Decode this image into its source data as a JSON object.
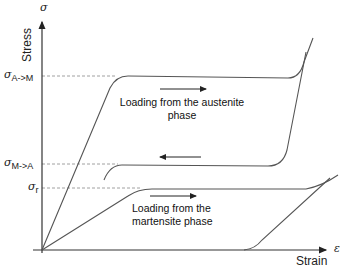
{
  "diagram": {
    "type": "stress-strain hysteresis (shape memory alloy)",
    "axes": {
      "y": {
        "symbol": "σ",
        "title": "Stress"
      },
      "x": {
        "symbol": "ε",
        "title": "Strain"
      }
    },
    "stress_levels": [
      {
        "id": "sigma_am",
        "symbol": "σ",
        "subscript": "A->M"
      },
      {
        "id": "sigma_ma",
        "symbol": "σ",
        "subscript": "M->A"
      },
      {
        "id": "sigma_r",
        "symbol": "σ",
        "subscript": "r"
      }
    ],
    "annotations": {
      "austenite": {
        "line1": "Loading from the austenite",
        "line2": "phase",
        "arrow": "right"
      },
      "unloading": {
        "arrow": "left"
      },
      "martensite": {
        "line1": "Loading from the",
        "line2": "martensite phase",
        "arrow": "right"
      }
    },
    "colors": {
      "curve": "#555555",
      "axis": "#333333",
      "dashed": "#888888"
    }
  }
}
